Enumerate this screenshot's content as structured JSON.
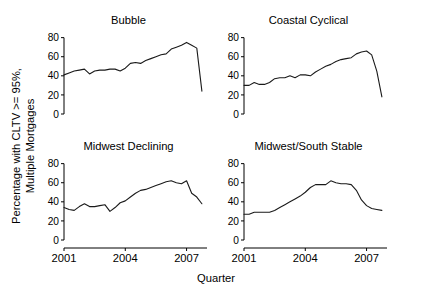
{
  "figure": {
    "ylabel_line1": "Percentage with CLTV >= 95%,",
    "ylabel_line2": "Multiple Mortgages",
    "xlabel": "Quarter",
    "line_color": "#1a1a1a",
    "axis_color": "#000000",
    "background": "#ffffff"
  },
  "chart_data": [
    {
      "type": "line",
      "title": "Bubble",
      "xlabel": "Quarter",
      "ylabel": "Percentage with CLTV >= 95%, Multiple Mortgages",
      "xlim": [
        2001.0,
        2008.0
      ],
      "ylim": [
        0,
        88
      ],
      "yticks": [
        0,
        20,
        40,
        60,
        80
      ],
      "xticks": [
        2001,
        2004,
        2007
      ],
      "grid": false,
      "legend": "none",
      "x": [
        2001.0,
        2001.25,
        2001.5,
        2001.75,
        2002.0,
        2002.25,
        2002.5,
        2002.75,
        2003.0,
        2003.25,
        2003.5,
        2003.75,
        2004.0,
        2004.25,
        2004.5,
        2004.75,
        2005.0,
        2005.25,
        2005.5,
        2005.75,
        2006.0,
        2006.25,
        2006.5,
        2006.75,
        2007.0,
        2007.25,
        2007.5
      ],
      "values": [
        41,
        43,
        45,
        46,
        47,
        42,
        45,
        46,
        46,
        47,
        47,
        45,
        48,
        53,
        54,
        53,
        56,
        58,
        60,
        62,
        63,
        68,
        70,
        72,
        75,
        72,
        69,
        24
      ]
    },
    {
      "type": "line",
      "title": "Coastal Cyclical",
      "xlabel": "Quarter",
      "ylabel": "Percentage with CLTV >= 95%, Multiple Mortgages",
      "xlim": [
        2001.0,
        2008.0
      ],
      "ylim": [
        0,
        88
      ],
      "yticks": [
        0,
        20,
        40,
        60,
        80
      ],
      "xticks": [
        2001,
        2004,
        2007
      ],
      "grid": false,
      "legend": "none",
      "x": [
        2001.0,
        2001.25,
        2001.5,
        2001.75,
        2002.0,
        2002.25,
        2002.5,
        2002.75,
        2003.0,
        2003.25,
        2003.5,
        2003.75,
        2004.0,
        2004.25,
        2004.5,
        2004.75,
        2005.0,
        2005.25,
        2005.5,
        2005.75,
        2006.0,
        2006.25,
        2006.5,
        2006.75,
        2007.0,
        2007.25,
        2007.5
      ],
      "values": [
        30,
        30,
        33,
        31,
        31,
        33,
        37,
        38,
        38,
        40,
        38,
        41,
        41,
        40,
        44,
        47,
        50,
        52,
        55,
        57,
        58,
        59,
        63,
        65,
        66,
        62,
        45,
        18
      ]
    },
    {
      "type": "line",
      "title": "Midwest Declining",
      "xlabel": "Quarter",
      "ylabel": "Percentage with CLTV >= 95%, Multiple Mortgages",
      "xlim": [
        2001.0,
        2008.0
      ],
      "ylim": [
        0,
        88
      ],
      "yticks": [
        0,
        20,
        40,
        60,
        80
      ],
      "xticks": [
        2001,
        2004,
        2007
      ],
      "grid": false,
      "legend": "none",
      "x": [
        2001.0,
        2001.25,
        2001.5,
        2001.75,
        2002.0,
        2002.25,
        2002.5,
        2002.75,
        2003.0,
        2003.25,
        2003.5,
        2003.75,
        2004.0,
        2004.25,
        2004.5,
        2004.75,
        2005.0,
        2005.25,
        2005.5,
        2005.75,
        2006.0,
        2006.25,
        2006.5,
        2006.75,
        2007.0,
        2007.25,
        2007.5
      ],
      "values": [
        34,
        32,
        31,
        35,
        38,
        35,
        35,
        36,
        37,
        30,
        34,
        39,
        41,
        45,
        49,
        52,
        53,
        55,
        57,
        59,
        61,
        62,
        60,
        59,
        62,
        49,
        45,
        38
      ]
    },
    {
      "type": "line",
      "title": "Midwest/South Stable",
      "xlabel": "Quarter",
      "ylabel": "Percentage with CLTV >= 95%, Multiple Mortgages",
      "xlim": [
        2001.0,
        2008.0
      ],
      "ylim": [
        0,
        88
      ],
      "yticks": [
        0,
        20,
        40,
        60,
        80
      ],
      "xticks": [
        2001,
        2004,
        2007
      ],
      "grid": false,
      "legend": "none",
      "x": [
        2001.0,
        2001.25,
        2001.5,
        2001.75,
        2002.0,
        2002.25,
        2002.5,
        2002.75,
        2003.0,
        2003.25,
        2003.5,
        2003.75,
        2004.0,
        2004.25,
        2004.5,
        2004.75,
        2005.0,
        2005.25,
        2005.5,
        2005.75,
        2006.0,
        2006.25,
        2006.5,
        2006.75,
        2007.0,
        2007.25,
        2007.5
      ],
      "values": [
        27,
        27,
        29,
        29,
        29,
        29,
        31,
        34,
        37,
        40,
        43,
        46,
        50,
        55,
        58,
        58,
        58,
        62,
        60,
        59,
        59,
        58,
        52,
        42,
        36,
        33,
        32,
        31
      ]
    }
  ],
  "axes": {
    "ytick_labels": [
      "80",
      "60",
      "40",
      "20",
      "0"
    ],
    "xtick_labels": [
      "2001",
      "2004",
      "2007"
    ]
  }
}
